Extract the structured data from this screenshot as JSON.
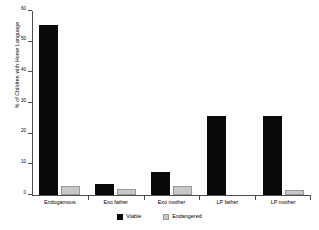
{
  "chart_data": {
    "type": "bar",
    "title": "",
    "subtitle": "",
    "xlabel": "",
    "ylabel": "% of Children with Home Language",
    "categories": [
      "Endogamous",
      "Exo father",
      "Exo mother",
      "LP father",
      "LP mother"
    ],
    "series": [
      {
        "name": "Viable",
        "color": "#0a0a0a",
        "values": [
          55.5,
          3.5,
          7.5,
          25.7,
          25.7
        ]
      },
      {
        "name": "Endangered",
        "color": "#c8c8c8",
        "values": [
          3.0,
          2.0,
          3.0,
          0.0,
          1.5
        ]
      }
    ],
    "ylim": [
      0,
      60
    ],
    "yticks": [
      0,
      10,
      20,
      30,
      40,
      50,
      60
    ],
    "ytick_labels": [
      "0",
      "10",
      "20",
      "30",
      "40",
      "50",
      "60"
    ],
    "grid": false,
    "legend_position": "bottom-center",
    "legend_entries": [
      "Viable",
      "Endangered"
    ]
  }
}
